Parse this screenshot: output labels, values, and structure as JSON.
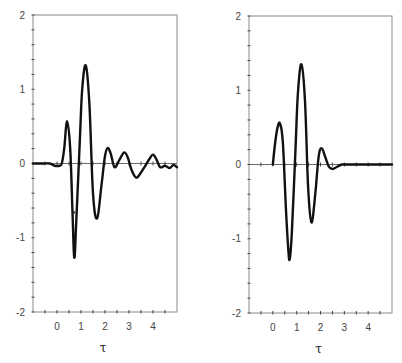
{
  "chart_data": [
    {
      "type": "line",
      "title": "",
      "xlabel": "τ",
      "ylabel": "",
      "xlim": [
        -1,
        5
      ],
      "ylim": [
        -2,
        2
      ],
      "xticks": [
        0,
        1,
        2,
        3,
        4
      ],
      "yticks": [
        -2,
        -1,
        0,
        1,
        2
      ],
      "grid": false,
      "legend": null,
      "series": [
        {
          "name": "left-waveform",
          "x": [
            -1.0,
            -0.6,
            -0.3,
            -0.1,
            0.1,
            0.2,
            0.3,
            0.42,
            0.55,
            0.65,
            0.72,
            0.8,
            0.95,
            1.05,
            1.2,
            1.35,
            1.5,
            1.67,
            1.85,
            2.0,
            2.12,
            2.25,
            2.4,
            2.6,
            2.8,
            2.95,
            3.1,
            3.3,
            3.5,
            3.7,
            3.85,
            4.0,
            4.15,
            4.3,
            4.5,
            4.7,
            4.85,
            5.0
          ],
          "values": [
            0.0,
            0.0,
            0.0,
            -0.03,
            -0.03,
            0.0,
            0.2,
            0.57,
            0.2,
            -0.7,
            -1.27,
            -0.8,
            0.3,
            1.0,
            1.32,
            0.8,
            -0.4,
            -0.74,
            -0.3,
            0.1,
            0.21,
            0.12,
            -0.05,
            0.05,
            0.15,
            0.08,
            -0.08,
            -0.19,
            -0.12,
            -0.02,
            0.06,
            0.12,
            0.05,
            -0.05,
            -0.03,
            -0.06,
            -0.02,
            -0.05
          ]
        },
        {
          "name": "left-marker",
          "type": "scatter",
          "x": [
            0.71
          ],
          "values": [
            -0.66
          ]
        }
      ]
    },
    {
      "type": "line",
      "title": "",
      "xlabel": "τ",
      "ylabel": "",
      "xlim": [
        -1,
        5
      ],
      "ylim": [
        -2,
        2
      ],
      "xticks": [
        0,
        1,
        2,
        3,
        4
      ],
      "yticks": [
        -2,
        -1,
        0,
        1,
        2
      ],
      "grid": false,
      "legend": null,
      "series": [
        {
          "name": "right-waveform",
          "x": [
            0.0,
            0.1,
            0.2,
            0.3,
            0.42,
            0.55,
            0.65,
            0.71,
            0.8,
            0.95,
            1.05,
            1.2,
            1.35,
            1.48,
            1.62,
            1.78,
            1.92,
            2.05,
            2.2,
            2.35,
            2.5,
            2.7,
            2.9,
            3.2,
            5.0
          ],
          "values": [
            0.0,
            0.3,
            0.5,
            0.55,
            0.3,
            -0.6,
            -1.15,
            -1.27,
            -0.9,
            0.2,
            0.95,
            1.35,
            0.85,
            -0.3,
            -0.78,
            -0.4,
            0.1,
            0.22,
            0.1,
            -0.03,
            -0.06,
            -0.03,
            0.0,
            0.0,
            0.0
          ]
        }
      ]
    }
  ],
  "panels": [
    {
      "id": "left",
      "box": {
        "x0": 33,
        "y0": 15,
        "x1": 177,
        "y1": 312
      }
    },
    {
      "id": "right",
      "box": {
        "x0": 249,
        "y0": 16,
        "x1": 392,
        "y1": 313
      }
    }
  ]
}
